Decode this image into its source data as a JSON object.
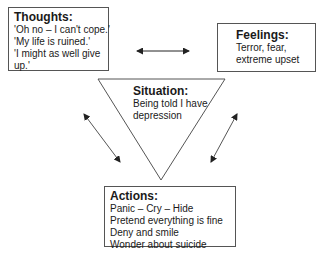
{
  "diagram": {
    "type": "cognitive-behavioural cycle",
    "thoughts": {
      "title": "Thoughts:",
      "lines": [
        "'Oh no – I can't cope.'",
        "'My life is ruined.'",
        "'I might as well give",
        "up.'"
      ]
    },
    "feelings": {
      "title": "Feelings:",
      "lines": [
        "Terror, fear,",
        "extreme upset"
      ]
    },
    "situation": {
      "title": "Situation:",
      "lines": [
        "Being told I have",
        "depression"
      ]
    },
    "actions": {
      "title": "Actions:",
      "lines": [
        "Panic – Cry – Hide",
        "Pretend everything is fine",
        "Deny and smile",
        "Wonder about suicide"
      ]
    },
    "connections": [
      {
        "from": "thoughts",
        "to": "feelings",
        "style": "double-arrow"
      },
      {
        "from": "thoughts",
        "to": "actions",
        "style": "double-arrow"
      },
      {
        "from": "feelings",
        "to": "actions",
        "style": "double-arrow"
      }
    ],
    "colors": {
      "stroke": "#555555",
      "arrow": "#222222",
      "text": "#1a1a1a",
      "background": "#ffffff"
    }
  }
}
